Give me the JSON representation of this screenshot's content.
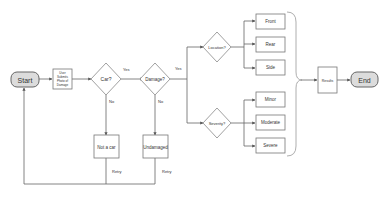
{
  "diagram": {
    "type": "flowchart",
    "nodes": {
      "start": {
        "label": "Start",
        "shape": "terminal"
      },
      "submit": {
        "label": "User Submits Photo of Damage",
        "lines": [
          "User",
          "Submits",
          "Photo of",
          "Damage"
        ],
        "shape": "process"
      },
      "car": {
        "label": "Car?",
        "shape": "decision"
      },
      "damage": {
        "label": "Damage?",
        "shape": "decision"
      },
      "not_car": {
        "label": "Not a car",
        "shape": "process"
      },
      "undamaged": {
        "label": "Undamaged",
        "shape": "process"
      },
      "location": {
        "label": "Location?",
        "shape": "decision"
      },
      "severity": {
        "label": "Severity?",
        "shape": "decision"
      },
      "front": {
        "label": "Front",
        "shape": "process"
      },
      "rear": {
        "label": "Rear",
        "shape": "process"
      },
      "side": {
        "label": "Side",
        "shape": "process"
      },
      "minor": {
        "label": "Minor",
        "shape": "process"
      },
      "moderate": {
        "label": "Moderate",
        "shape": "process"
      },
      "severe": {
        "label": "Severe",
        "shape": "process"
      },
      "results": {
        "label": "Results",
        "shape": "process"
      },
      "end": {
        "label": "End",
        "shape": "terminal"
      }
    },
    "edge_labels": {
      "car_yes": "Yes",
      "car_no": "No",
      "damage_yes": "Yes",
      "damage_no": "No",
      "not_car_retry": "Retry",
      "undamaged_retry": "Retry"
    },
    "edges": [
      {
        "from": "start",
        "to": "submit"
      },
      {
        "from": "submit",
        "to": "car"
      },
      {
        "from": "car",
        "to": "damage",
        "label": "Yes"
      },
      {
        "from": "car",
        "to": "not_car",
        "label": "No"
      },
      {
        "from": "damage",
        "to": "location",
        "label": "Yes"
      },
      {
        "from": "damage",
        "to": "severity",
        "label": "Yes"
      },
      {
        "from": "damage",
        "to": "undamaged",
        "label": "No"
      },
      {
        "from": "not_car",
        "to": "start",
        "label": "Retry"
      },
      {
        "from": "undamaged",
        "to": "start",
        "label": "Retry"
      },
      {
        "from": "location",
        "to": "front"
      },
      {
        "from": "location",
        "to": "rear"
      },
      {
        "from": "location",
        "to": "side"
      },
      {
        "from": "severity",
        "to": "minor"
      },
      {
        "from": "severity",
        "to": "moderate"
      },
      {
        "from": "severity",
        "to": "severe"
      },
      {
        "from": "results",
        "to": "end"
      }
    ],
    "colors": {
      "terminal_fill": "#dcdcdc",
      "line": "#666666",
      "box_stroke": "#777777"
    }
  }
}
